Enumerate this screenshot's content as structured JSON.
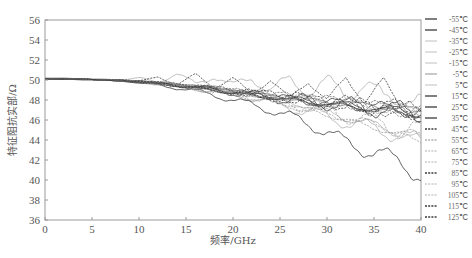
{
  "chart_data": {
    "type": "line",
    "title": "",
    "xlabel": "频率/GHz",
    "ylabel": "特征阻抗实部/Ω",
    "xlim": [
      0,
      40
    ],
    "ylim": [
      36,
      56
    ],
    "xticks": [
      0,
      5,
      10,
      15,
      20,
      25,
      30,
      35,
      40
    ],
    "yticks": [
      36,
      38,
      40,
      42,
      44,
      46,
      48,
      50,
      52,
      54,
      56
    ],
    "grid": false,
    "legend_position": "right-outside",
    "x": [
      0,
      2,
      4,
      6,
      8,
      10,
      12,
      14,
      16,
      18,
      20,
      22,
      24,
      26,
      28,
      30,
      32,
      34,
      36,
      38,
      40
    ],
    "series": [
      {
        "name": "-55℃",
        "style": "solid-dark",
        "values": [
          50.1,
          50.1,
          50.1,
          50.0,
          49.9,
          49.8,
          49.6,
          49.4,
          49.2,
          49.0,
          48.7,
          48.4,
          48.2,
          48.0,
          47.8,
          47.6,
          47.4,
          47.2,
          47.0,
          46.8,
          46.5
        ]
      },
      {
        "name": "-45℃",
        "style": "solid-dark",
        "values": [
          50.1,
          50.1,
          50.1,
          50.0,
          49.9,
          49.9,
          49.7,
          49.5,
          49.3,
          49.1,
          48.8,
          48.6,
          48.4,
          48.1,
          47.9,
          47.7,
          47.6,
          47.4,
          47.2,
          47.0,
          46.8
        ]
      },
      {
        "name": "-35℃",
        "style": "solid-light",
        "values": [
          50.2,
          50.2,
          50.1,
          50.1,
          50.0,
          50.2,
          49.8,
          50.6,
          49.6,
          50.4,
          49.4,
          50.2,
          49.0,
          50.0,
          48.8,
          49.8,
          48.6,
          49.6,
          48.2,
          48.4,
          47.6
        ]
      },
      {
        "name": "-25℃",
        "style": "solid-light",
        "values": [
          50.2,
          50.2,
          50.1,
          50.0,
          50.0,
          49.8,
          49.6,
          49.5,
          49.3,
          49.2,
          48.8,
          48.6,
          48.3,
          47.8,
          47.4,
          46.8,
          46.2,
          45.8,
          45.2,
          44.6,
          44.0
        ]
      },
      {
        "name": "-15℃",
        "style": "solid-light",
        "values": [
          50.1,
          50.1,
          50.1,
          50.0,
          49.9,
          49.7,
          49.6,
          49.4,
          49.1,
          48.9,
          48.6,
          48.2,
          47.8,
          47.3,
          46.8,
          46.3,
          45.8,
          45.4,
          44.9,
          44.4,
          43.8
        ]
      },
      {
        "name": "-5℃",
        "style": "solid-mid",
        "values": [
          50.1,
          50.1,
          50.1,
          50.0,
          50.0,
          49.9,
          49.7,
          49.5,
          49.3,
          49.1,
          48.9,
          48.7,
          48.4,
          48.2,
          48.0,
          47.8,
          47.6,
          47.5,
          47.3,
          47.1,
          47.0
        ]
      },
      {
        "name": "5℃",
        "style": "solid-light",
        "values": [
          50.1,
          50.1,
          50.1,
          50.1,
          50.0,
          49.9,
          49.8,
          49.6,
          49.4,
          49.2,
          48.9,
          48.7,
          48.5,
          48.2,
          48.0,
          47.8,
          47.6,
          47.4,
          47.2,
          47.0,
          46.8
        ]
      },
      {
        "name": "15℃",
        "style": "solid-dark",
        "values": [
          50.1,
          50.1,
          50.1,
          50.0,
          49.9,
          49.8,
          49.6,
          49.5,
          49.3,
          49.0,
          48.8,
          48.5,
          48.3,
          48.1,
          47.9,
          47.7,
          47.5,
          47.3,
          47.1,
          46.9,
          46.7
        ]
      },
      {
        "name": "25℃",
        "style": "solid-dark",
        "values": [
          50.1,
          50.1,
          50.1,
          50.0,
          50.0,
          49.8,
          49.7,
          49.5,
          49.3,
          49.1,
          48.8,
          48.6,
          48.4,
          48.1,
          47.9,
          47.7,
          47.5,
          47.3,
          47.1,
          46.9,
          46.6
        ]
      },
      {
        "name": "35℃",
        "style": "solid-dark",
        "values": [
          50.1,
          50.1,
          50.0,
          50.0,
          49.9,
          49.7,
          49.5,
          49.2,
          48.9,
          48.5,
          48.0,
          47.5,
          47.0,
          46.4,
          45.6,
          44.8,
          43.8,
          43.0,
          42.5,
          41.8,
          40.2
        ]
      },
      {
        "name": "45℃",
        "style": "dashed-dark",
        "values": [
          50.1,
          50.1,
          50.1,
          50.0,
          50.0,
          49.9,
          50.3,
          49.5,
          50.6,
          49.2,
          50.2,
          48.6,
          50.0,
          48.2,
          49.8,
          48.0,
          50.2,
          47.8,
          50.0,
          47.2,
          46.8
        ]
      },
      {
        "name": "55℃",
        "style": "dashed-mid",
        "values": [
          50.1,
          50.1,
          50.1,
          50.0,
          49.9,
          49.9,
          49.6,
          49.6,
          49.2,
          49.3,
          48.9,
          48.8,
          48.5,
          48.4,
          48.1,
          48.0,
          47.7,
          47.5,
          47.2,
          47.0,
          46.9
        ]
      },
      {
        "name": "65℃",
        "style": "dashed-light",
        "values": [
          50.1,
          50.1,
          50.1,
          50.0,
          50.0,
          49.8,
          49.7,
          49.4,
          49.2,
          48.9,
          48.7,
          48.4,
          48.1,
          47.7,
          47.3,
          46.9,
          46.5,
          46.0,
          45.6,
          45.2,
          44.8
        ]
      },
      {
        "name": "75℃",
        "style": "dashed-light",
        "values": [
          50.1,
          50.1,
          50.1,
          50.0,
          49.9,
          49.8,
          49.6,
          49.3,
          49.1,
          48.8,
          48.5,
          48.2,
          47.8,
          47.4,
          47.0,
          46.6,
          46.2,
          45.8,
          45.3,
          44.8,
          44.3
        ]
      },
      {
        "name": "85℃",
        "style": "dashed-dark",
        "values": [
          50.1,
          50.1,
          50.1,
          50.0,
          50.0,
          49.9,
          49.7,
          49.5,
          49.4,
          49.1,
          48.9,
          48.7,
          48.5,
          48.2,
          48.0,
          47.8,
          47.6,
          47.4,
          47.2,
          47.0,
          46.9
        ]
      },
      {
        "name": "95℃",
        "style": "dashed-light",
        "values": [
          50.1,
          50.1,
          50.1,
          50.0,
          49.9,
          49.8,
          49.6,
          49.4,
          49.2,
          48.9,
          48.6,
          48.3,
          48.0,
          47.5,
          47.0,
          46.5,
          46.0,
          45.5,
          45.0,
          44.4,
          43.9
        ]
      },
      {
        "name": "105℃",
        "style": "dashed-light",
        "values": [
          50.1,
          50.1,
          50.1,
          50.0,
          50.0,
          49.9,
          49.7,
          49.6,
          49.4,
          49.2,
          49.0,
          48.7,
          48.5,
          48.3,
          48.1,
          47.9,
          47.7,
          47.5,
          47.3,
          47.1,
          47.0
        ]
      },
      {
        "name": "115℃",
        "style": "dashed-dark",
        "values": [
          50.1,
          50.1,
          50.1,
          50.0,
          49.9,
          49.9,
          49.7,
          49.5,
          49.3,
          49.1,
          48.9,
          48.6,
          48.4,
          48.2,
          48.0,
          47.8,
          47.6,
          47.4,
          47.2,
          47.0,
          46.8
        ]
      },
      {
        "name": "125℃",
        "style": "dashed-dark",
        "values": [
          50.1,
          50.1,
          50.1,
          50.0,
          50.0,
          49.8,
          49.6,
          49.4,
          49.2,
          49.0,
          48.7,
          48.5,
          48.3,
          48.1,
          47.8,
          47.6,
          47.4,
          47.2,
          47.0,
          46.8,
          46.6
        ]
      }
    ]
  },
  "colors": {
    "axis": "#9a9a9a",
    "text": "#555555",
    "solid-dark": "#3a3a3a",
    "solid-mid": "#777777",
    "solid-light": "#b0b0b0",
    "dashed-dark": "#3a3a3a",
    "dashed-mid": "#6a6a6a",
    "dashed-light": "#9a9a9a"
  }
}
